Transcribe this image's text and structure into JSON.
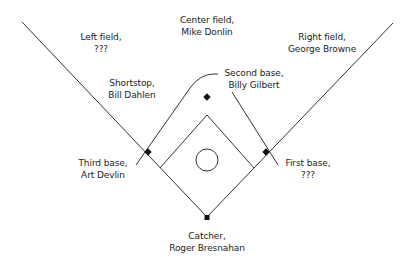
{
  "diagram": {
    "colors": {
      "line": "#333333",
      "base": "#111111",
      "text": "#222222",
      "background": "#ffffff"
    },
    "positions": [
      {
        "id": "left-field",
        "role": "Left field,",
        "player": "???"
      },
      {
        "id": "center-field",
        "role": "Center field,",
        "player": "Mike Donlin"
      },
      {
        "id": "right-field",
        "role": "Right field,",
        "player": "George Browne"
      },
      {
        "id": "shortstop",
        "role": "Shortstop,",
        "player": "Bill Dahlen"
      },
      {
        "id": "second-base",
        "role": "Second base,",
        "player": "Billy Gilbert"
      },
      {
        "id": "third-base",
        "role": "Third base,",
        "player": "Art Devlin"
      },
      {
        "id": "first-base",
        "role": "First base,",
        "player": "???"
      },
      {
        "id": "catcher",
        "role": "Catcher,",
        "player": "Roger Bresnahan"
      }
    ]
  }
}
